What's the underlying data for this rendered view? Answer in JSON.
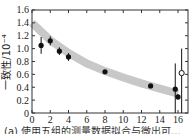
{
  "chart_data": {
    "type": "scatter",
    "title": "",
    "xlabel": "",
    "ylabel": "一致性/10⁻⁴",
    "xlim": [
      0,
      16
    ],
    "ylim": [
      0,
      1.6
    ],
    "x_ticks": [
      "0",
      "2",
      "4",
      "6",
      "8",
      "10",
      "12",
      "14",
      "16"
    ],
    "y_ticks": [
      "0",
      "0.2",
      "0.4",
      "0.6",
      "0.8",
      "1.0",
      "1.2",
      "1.4",
      "1.6"
    ],
    "grid": false,
    "series": [
      {
        "name": "measured",
        "marker": "filled-circle",
        "points": [
          {
            "x": 1.0,
            "y": 1.05,
            "err": 0.13
          },
          {
            "x": 2.0,
            "y": 1.12,
            "err": 0.07
          },
          {
            "x": 3.0,
            "y": 0.96,
            "err": 0.06
          },
          {
            "x": 4.0,
            "y": 0.87,
            "err": 0.06
          },
          {
            "x": 8.0,
            "y": 0.64,
            "err": 0.02
          },
          {
            "x": 13.0,
            "y": 0.42,
            "err": 0.03
          },
          {
            "x": 15.7,
            "y": 0.37,
            "err_up": 0.4,
            "err_down": 0.37
          },
          {
            "x": 16.0,
            "y": 0.25,
            "err": 0.04
          }
        ]
      },
      {
        "name": "open",
        "marker": "open-circle",
        "points": [
          {
            "x": 16.4,
            "y": 0.62,
            "err_up": 0.38,
            "err_down": 0.62
          }
        ]
      },
      {
        "name": "fit band",
        "type": "band",
        "x": [
          0,
          2,
          4,
          6,
          8,
          10,
          12,
          14,
          16
        ],
        "y": [
          1.4,
          1.13,
          0.93,
          0.77,
          0.65,
          0.55,
          0.46,
          0.38,
          0.3
        ]
      }
    ],
    "caption": "(a) 使用五组的测量数据拟合与微出可..."
  }
}
